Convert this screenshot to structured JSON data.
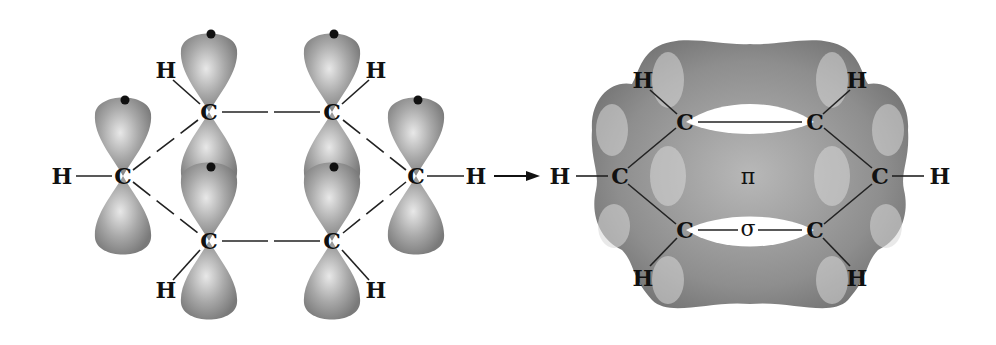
{
  "diagram": {
    "colors": {
      "orbital_fill": "#9a9a9a",
      "orbital_highlight": "#e6e6e6",
      "orbital_shadow": "#6e6e6e",
      "bond_line": "#222222",
      "label": "#111111",
      "background": "#ffffff"
    },
    "left_panel": {
      "description": "Six sp2 carbons, each with an unhybridized p orbital holding one electron",
      "atoms": [
        {
          "symbol": "C",
          "x": 123,
          "y": 176
        },
        {
          "symbol": "C",
          "x": 209,
          "y": 112
        },
        {
          "symbol": "C",
          "x": 332,
          "y": 112
        },
        {
          "symbol": "C",
          "x": 416,
          "y": 176
        },
        {
          "symbol": "C",
          "x": 332,
          "y": 241
        },
        {
          "symbol": "C",
          "x": 209,
          "y": 241
        }
      ],
      "hydrogens": [
        {
          "symbol": "H",
          "x": 62,
          "y": 176
        },
        {
          "symbol": "H",
          "x": 166,
          "y": 70
        },
        {
          "symbol": "H",
          "x": 376,
          "y": 70
        },
        {
          "symbol": "H",
          "x": 476,
          "y": 176
        },
        {
          "symbol": "H",
          "x": 166,
          "y": 290
        },
        {
          "symbol": "H",
          "x": 376,
          "y": 290
        }
      ],
      "electron_dot_count": 6
    },
    "arrow": {
      "label": "",
      "from_x": 494,
      "to_x": 538,
      "y": 176
    },
    "right_panel": {
      "description": "Continuous pi electron cloud above and below the sigma framework",
      "atoms": [
        {
          "symbol": "C",
          "x": 620,
          "y": 176
        },
        {
          "symbol": "C",
          "x": 685,
          "y": 122
        },
        {
          "symbol": "C",
          "x": 815,
          "y": 122
        },
        {
          "symbol": "C",
          "x": 880,
          "y": 176
        },
        {
          "symbol": "C",
          "x": 815,
          "y": 230
        },
        {
          "symbol": "C",
          "x": 685,
          "y": 230
        }
      ],
      "hydrogens": [
        {
          "symbol": "H",
          "x": 560,
          "y": 176
        },
        {
          "symbol": "H",
          "x": 643,
          "y": 80
        },
        {
          "symbol": "H",
          "x": 857,
          "y": 80
        },
        {
          "symbol": "H",
          "x": 940,
          "y": 176
        },
        {
          "symbol": "H",
          "x": 643,
          "y": 278
        },
        {
          "symbol": "H",
          "x": 857,
          "y": 278
        }
      ],
      "labels": {
        "pi": "π",
        "sigma": "σ"
      }
    }
  }
}
